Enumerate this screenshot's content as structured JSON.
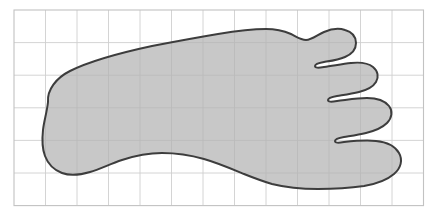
{
  "figure": {
    "description": "Shaded outline of a left foot (plantar view) drawn over a light rectangular grid, toes pointing right, heel at left.",
    "canvas": {
      "width": 437,
      "height": 216,
      "background": "#ffffff"
    }
  },
  "grid": {
    "name": "graph-paper-grid",
    "origin_x": 14,
    "origin_y": 10,
    "cell_width": 31.5,
    "cell_height": 32.6,
    "columns": 13,
    "rows": 6,
    "line_color": "#cfcfcf",
    "border_color": "#c2c2c2",
    "line_width": 0.9,
    "border_width": 1.1
  },
  "shape": {
    "name": "foot-outline",
    "label": "Foot",
    "fill_color": "#b3b3b3",
    "fill_opacity": 0.72,
    "stroke_color": "#3d3d3d",
    "stroke_width": 2.0,
    "orientation": "toes-right",
    "path": "M 48 102 C 47 90, 56 78, 70 71 C 92 60, 124 52, 152 46 C 178 41, 200 37, 218 34 C 236 31, 252 29, 266 29 C 276 29, 284 31, 291 34 C 297 37, 301 40, 306 40 C 312 40, 317 35, 324 32 C 331 29, 339 28, 345 30 C 352 32, 356 37, 356 43 C 356 49, 352 54, 345 57 C 338 60, 330 61, 324 62 C 318 63, 315 64, 315 66 C 315 68, 318 68, 324 67 C 332 66, 342 64, 351 63 C 360 62, 368 63, 373 67 C 378 71, 379 77, 376 82 C 373 87, 367 90, 359 92 C 351 94, 343 95, 337 96 C 331 97, 328 98, 328 100 C 328 102, 331 102, 337 101 C 346 100, 357 98, 367 98 C 377 98, 385 101, 389 106 C 393 111, 392 118, 387 123 C 382 128, 374 131, 366 133 C 358 135, 350 136, 344 137 C 338 138, 335 139, 335 141 C 335 143, 338 143, 344 142 C 354 141, 366 140, 376 141 C 387 142, 395 146, 399 153 C 403 160, 401 168, 394 174 C 387 180, 376 184, 364 186 C 350 188, 334 189, 318 189 C 300 189, 284 187, 272 184 C 262 181, 254 178, 244 174 C 232 169, 218 163, 204 159 C 190 155, 176 153, 162 153 C 148 153, 134 156, 122 160 C 110 164, 100 169, 90 172 C 80 175, 70 176, 62 173 C 54 170, 48 164, 45 156 C 42 148, 42 139, 43 130 C 44 121, 47 112, 48 102 Z"
  },
  "legend": {
    "visible": false
  }
}
